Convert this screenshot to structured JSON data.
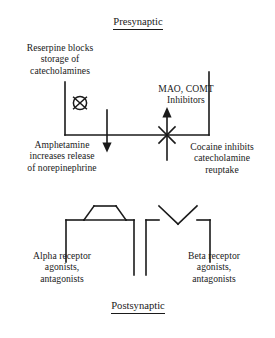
{
  "figure": {
    "kind": "synapse-pharmacology-diagram",
    "stroke_color": "#1a1a1a",
    "background_color": "#ffffff"
  },
  "headings": {
    "presynaptic": "Presynaptic",
    "postsynaptic": "Postsynaptic"
  },
  "labels": {
    "reserpine": "Reserpine blocks\nstorage of\ncatecholamines",
    "mao_comt": "MAO, COMT\nInhibitors",
    "amphetamine": "Amphetamine\nincreases release\nof norepinephrine",
    "cocaine": "Cocaine inhibits\ncatecholamine\nreuptake",
    "alpha_receptor": "Alpha receptor\nagonists,\nantagonists",
    "beta_receptor": "Beta receptor\nagonists,\nantagonists"
  },
  "symbols": {
    "vesicle_blocked": "crossed-circle-icon",
    "release_arrow": "down-arrow-icon",
    "reuptake_arrow": "up-arrow-icon",
    "reuptake_blocked": "x-block-icon",
    "alpha_receptor_shape": "trapezoid-notch-icon",
    "beta_receptor_shape": "v-notch-icon"
  }
}
